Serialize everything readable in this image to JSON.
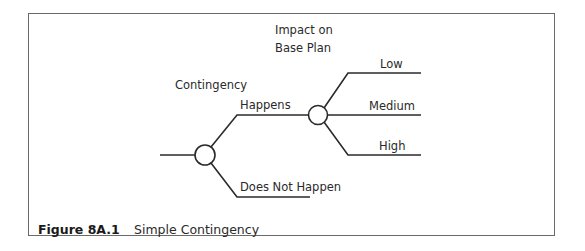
{
  "diagram": {
    "type": "decision-tree",
    "header": {
      "line1": "Impact on",
      "line2": "Base Plan"
    },
    "column_label": "Contingency",
    "root_node": {
      "branches": [
        {
          "label": "Happens",
          "leads_to": "impact_node"
        },
        {
          "label": "Does Not Happen"
        }
      ]
    },
    "impact_node": {
      "branches": [
        {
          "label": "Low"
        },
        {
          "label": "Medium"
        },
        {
          "label": "High"
        }
      ]
    },
    "colors": {
      "line": "#2a2a2a",
      "frame": "#6a6a6a",
      "node_fill": "#ffffff"
    }
  },
  "caption": {
    "number": "Figure 8A.1",
    "text": "Simple Contingency"
  }
}
